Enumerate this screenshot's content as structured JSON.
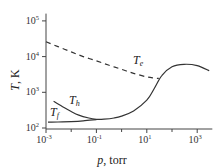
{
  "chart_data": {
    "type": "line",
    "title": "",
    "xlabel": "p, torr",
    "ylabel": "T, K",
    "xscale": "log",
    "yscale": "log",
    "xlim": [
      0.001,
      3981
    ],
    "ylim": [
      100,
      160000
    ],
    "grid": false,
    "x_ticks": [
      {
        "value": 0.001,
        "base": "10",
        "exp": "-3"
      },
      {
        "value": 0.1,
        "base": "10",
        "exp": "-1"
      },
      {
        "value": 10,
        "base": "10",
        "exp": "1"
      },
      {
        "value": 1000,
        "base": "10",
        "exp": "3"
      }
    ],
    "x_minor_ticks": [
      0.01,
      1,
      100
    ],
    "y_ticks": [
      {
        "value": 100,
        "base": "10",
        "exp": "2"
      },
      {
        "value": 1000,
        "base": "10",
        "exp": "3"
      },
      {
        "value": 10000,
        "base": "10",
        "exp": "4"
      },
      {
        "value": 100000,
        "base": "10",
        "exp": "5"
      }
    ],
    "series": [
      {
        "name": "Te",
        "label_main": "T",
        "label_sub": "e",
        "style": "dashed",
        "x": [
          0.001,
          0.003,
          0.01,
          0.03,
          0.1,
          0.3,
          1,
          3,
          10,
          20,
          30
        ],
        "y": [
          26000,
          19000,
          13500,
          10000,
          7600,
          5800,
          4400,
          3400,
          2700,
          2500,
          2450
        ]
      },
      {
        "name": "Th",
        "label_main": "T",
        "label_sub": "h",
        "style": "solid",
        "x": [
          0.002,
          0.005,
          0.01,
          0.02,
          0.05,
          0.1,
          0.2,
          0.5,
          1,
          3,
          10,
          20,
          40,
          100,
          300,
          1000,
          3000
        ],
        "y": [
          560,
          380,
          290,
          230,
          190,
          175,
          176,
          190,
          215,
          300,
          600,
          1300,
          3000,
          5200,
          6100,
          5600,
          4000
        ]
      },
      {
        "name": "Tf",
        "label_main": "T",
        "label_sub": "f",
        "style": "solid",
        "x": [
          0.0012,
          0.003,
          0.01,
          0.03,
          0.1
        ],
        "y": [
          145,
          147,
          150,
          158,
          172
        ]
      }
    ]
  }
}
